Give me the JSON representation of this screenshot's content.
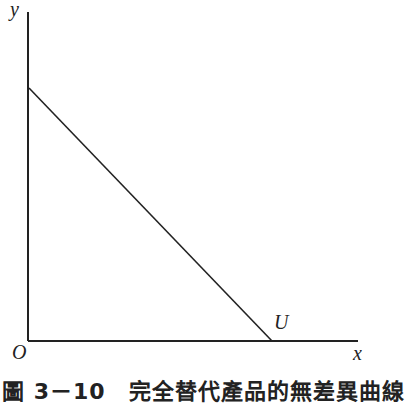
{
  "figure": {
    "caption": "圖 3－10　完全替代產品的無差異曲線",
    "axes": {
      "y_label": "y",
      "x_label": "x",
      "origin_label": "O"
    },
    "curve_label": "U",
    "colors": {
      "line": "#222222",
      "background": "#ffffff"
    }
  }
}
